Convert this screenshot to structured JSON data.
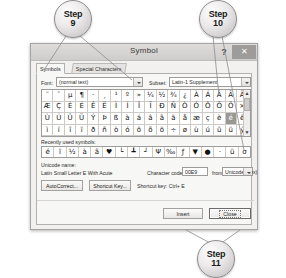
{
  "callouts": [
    {
      "name": "step-9",
      "word": "Step",
      "num": "9"
    },
    {
      "name": "step-10",
      "word": "Step",
      "num": "10"
    },
    {
      "name": "step-11",
      "word": "Step",
      "num": "11"
    }
  ],
  "dialog": {
    "title": "Symbol",
    "help_label": "?",
    "close_label": "✕",
    "tabs": [
      {
        "label": "Symbols",
        "active": true
      },
      {
        "label": "Special Characters",
        "active": false
      }
    ],
    "font": {
      "label": "Font:",
      "value": "(normal text)"
    },
    "subset": {
      "label": "Subset:",
      "value": "Latin-1 Supplement"
    },
    "grid_rows": [
      [
        "¨",
        "¯",
        "µ",
        "¶",
        "·",
        "¸",
        "¹",
        "º",
        "»",
        "¼",
        "½",
        "¾",
        "¿",
        "À",
        "Á",
        "Â",
        "Ã",
        "Ä",
        "Å"
      ],
      [
        "Æ",
        "Ç",
        "È",
        "É",
        "Ê",
        "Ë",
        "Ì",
        "Í",
        "Î",
        "Ï",
        "Ð",
        "Ñ",
        "Ò",
        "Ó",
        "Ô",
        "Õ",
        "Ö",
        "×",
        "Ø"
      ],
      [
        "Ù",
        "Ú",
        "Û",
        "Ü",
        "Ý",
        "Þ",
        "ß",
        "à",
        "á",
        "â",
        "ã",
        "ä",
        "å",
        "æ",
        "ç",
        "è",
        "é",
        "ê",
        "ë"
      ],
      [
        "ì",
        "í",
        "î",
        "ï",
        "ð",
        "ñ",
        "ò",
        "ó",
        "ô",
        "õ",
        "ö",
        "÷",
        "ø",
        "ù",
        "ú",
        "û",
        "ü",
        "ý",
        "þ"
      ]
    ],
    "grid_selected": {
      "row": 2,
      "col": 16
    },
    "scrollbar": {
      "up": "▲",
      "down": "▼"
    },
    "recent": {
      "label": "Recently used symbols:",
      "items": [
        "é",
        "î",
        "½",
        "à",
        "ã",
        "♥",
        "└",
        "┻",
        "┘",
        "Ψ",
        "‰",
        "ƒ",
        "▼",
        "●",
        "·",
        "ü",
        "σ",
        "╳",
        "♀"
      ]
    },
    "unicode_name": {
      "label": "Unicode name:",
      "value": "Latin Small Letter E With Acute"
    },
    "character_code": {
      "label": "Character code:",
      "value": "00E9"
    },
    "from": {
      "label": "from:",
      "value": "Unicode (hex)"
    },
    "autocorrect_button": "AutoCorrect...",
    "shortcut_key_button": "Shortcut Key...",
    "shortcut_key_label": "Shortcut key: Ctrl+ E",
    "insert_button": "Insert",
    "close_button": "Close"
  }
}
